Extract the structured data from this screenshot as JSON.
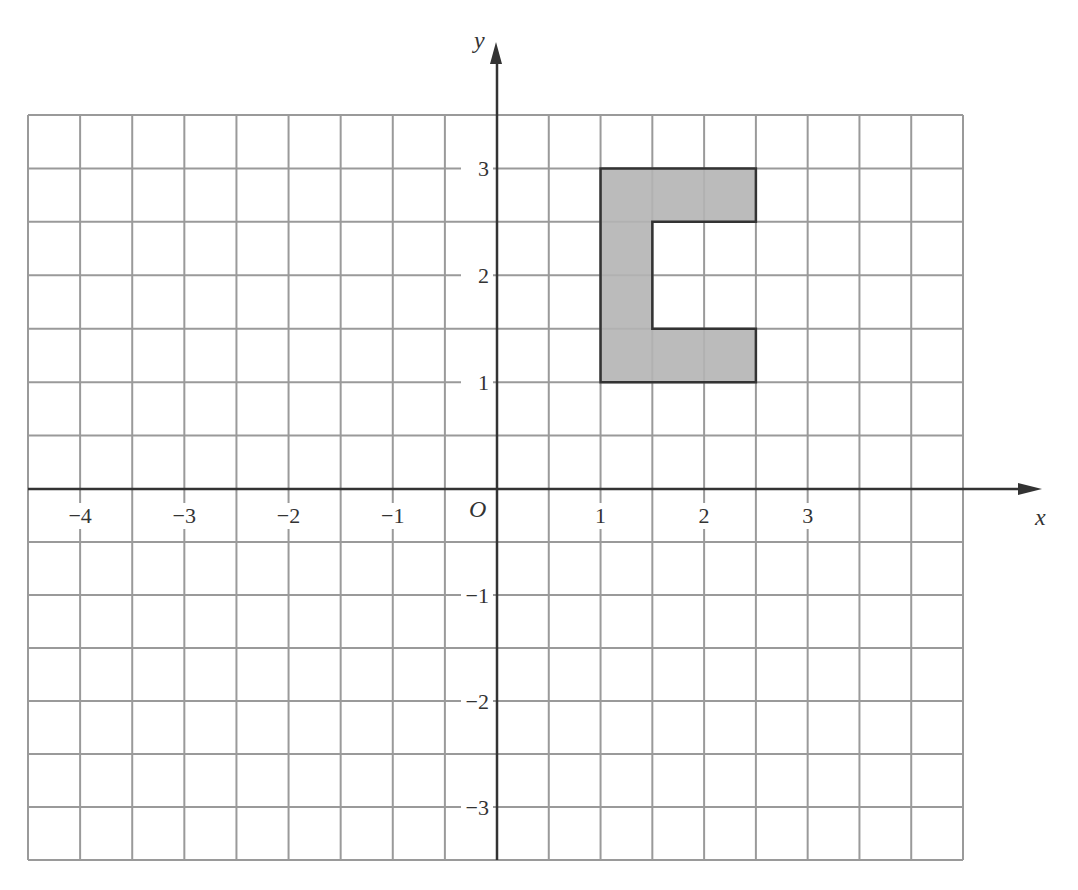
{
  "chart_data": {
    "type": "diagram",
    "title": "",
    "xlabel": "x",
    "ylabel": "y",
    "origin_label": "O",
    "xlim": [
      -4.5,
      4.5
    ],
    "ylim": [
      -3.5,
      3.5
    ],
    "grid": true,
    "grid_step": 0.5,
    "x_ticks": [
      -4,
      -3,
      -2,
      -1,
      1,
      2,
      3
    ],
    "x_tick_labels": [
      "−4",
      "−3",
      "−2",
      "−1",
      "1",
      "2",
      "3"
    ],
    "y_ticks": [
      3,
      2,
      1,
      -1,
      -2,
      -3
    ],
    "y_tick_labels": [
      "3",
      "2",
      "1",
      "−1",
      "−2",
      "−3"
    ],
    "shapes": [
      {
        "name": "shaded-c-shape",
        "fill": "#b4b4b4",
        "stroke": "#333333",
        "vertices": [
          [
            1,
            1
          ],
          [
            2.5,
            1
          ],
          [
            2.5,
            1.5
          ],
          [
            1.5,
            1.5
          ],
          [
            1.5,
            2.5
          ],
          [
            2.5,
            2.5
          ],
          [
            2.5,
            3
          ],
          [
            1,
            3
          ]
        ]
      }
    ]
  },
  "colors": {
    "grid": "#9a9a9a",
    "axis": "#333333",
    "shape_fill": "#b4b4b4",
    "shape_stroke": "#2e2e2e"
  }
}
